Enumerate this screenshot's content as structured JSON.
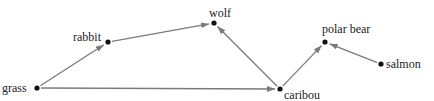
{
  "diagram": {
    "type": "food-web",
    "nodes": [
      {
        "id": "grass",
        "label": "grass",
        "x": 37,
        "y": 88
      },
      {
        "id": "rabbit",
        "label": "rabbit",
        "x": 108,
        "y": 42
      },
      {
        "id": "wolf",
        "label": "wolf",
        "x": 214,
        "y": 23
      },
      {
        "id": "caribou",
        "label": "caribou",
        "x": 280,
        "y": 89
      },
      {
        "id": "polar_bear",
        "label": "polar bear",
        "x": 325,
        "y": 42
      },
      {
        "id": "salmon",
        "label": "salmon",
        "x": 381,
        "y": 64
      }
    ],
    "edges": [
      {
        "from": "grass",
        "to": "rabbit"
      },
      {
        "from": "rabbit",
        "to": "wolf"
      },
      {
        "from": "grass",
        "to": "caribou"
      },
      {
        "from": "caribou",
        "to": "wolf"
      },
      {
        "from": "caribou",
        "to": "polar_bear"
      },
      {
        "from": "salmon",
        "to": "polar_bear"
      }
    ],
    "colors": {
      "edge": "#7a7a7a",
      "node": "#111111",
      "text": "#222222"
    }
  }
}
